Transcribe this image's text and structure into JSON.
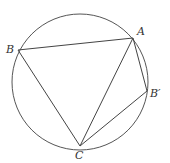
{
  "diagram": {
    "title": "",
    "circle": {
      "cx": 80,
      "cy": 82,
      "r": 68,
      "stroke": "#555555"
    },
    "points": {
      "A": {
        "label": "A",
        "x": 133,
        "y": 38,
        "lx": 137,
        "ly": 35
      },
      "B": {
        "label": "B",
        "x": 18,
        "y": 50,
        "lx": 6,
        "ly": 53
      },
      "Bp": {
        "label": "B′",
        "x": 147,
        "y": 91,
        "lx": 150,
        "ly": 97
      },
      "C": {
        "label": "C",
        "x": 80,
        "y": 146,
        "lx": 75,
        "ly": 159
      }
    },
    "segments": [
      [
        "B",
        "A"
      ],
      [
        "B",
        "C"
      ],
      [
        "A",
        "C"
      ],
      [
        "A",
        "Bp"
      ],
      [
        "Bp",
        "C"
      ]
    ],
    "line_color": "#444444"
  }
}
